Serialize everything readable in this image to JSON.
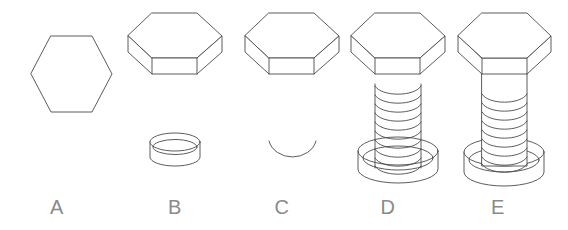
{
  "diagram": {
    "background_color": "#ffffff",
    "line_color": "#4a4a4a",
    "label_color": "#8a8a8a",
    "stage_count": 5,
    "stages": [
      {
        "label": "A",
        "name": "hexagon-outline",
        "caption": "A",
        "parts": [
          "hexagon"
        ],
        "label_x": 57,
        "center_x": 71
      },
      {
        "label": "B",
        "name": "hex-head-and-washer",
        "caption": "B",
        "parts": [
          "hex-head",
          "washer"
        ],
        "label_x": 155,
        "center_x": 175
      },
      {
        "label": "C",
        "name": "hex-head-and-washer-arc",
        "caption": "C",
        "parts": [
          "hex-head",
          "washer-arc"
        ],
        "label_x": 262,
        "center_x": 292
      },
      {
        "label": "D",
        "name": "hex-head-threads-washer",
        "caption": "D",
        "parts": [
          "hex-head",
          "threaded-shaft",
          "washer"
        ],
        "label_x": 368,
        "center_x": 398
      },
      {
        "label": "E",
        "name": "complete-bolt-assembly",
        "caption": "E",
        "parts": [
          "hex-head",
          "shaft",
          "threaded-shaft",
          "washer"
        ],
        "label_x": 478,
        "center_x": 504
      }
    ]
  }
}
